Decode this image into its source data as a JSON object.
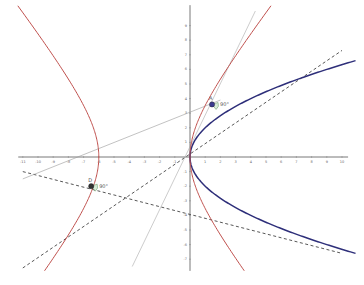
{
  "chart_data": {
    "type": "line",
    "title": "",
    "xlabel": "",
    "ylabel": "",
    "xlim": [
      -11.3,
      10.4
    ],
    "ylim": [
      -7.8,
      10.4
    ],
    "grid": false,
    "x_ticks": [
      -11,
      -10,
      -9,
      -8,
      -7,
      -6,
      -5,
      -4,
      -3,
      -2,
      -1,
      1,
      2,
      3,
      4,
      5,
      6,
      7,
      8,
      9,
      10
    ],
    "y_ticks": [
      -7,
      -6,
      -5,
      -4,
      -3,
      -2,
      -1,
      1,
      2,
      3,
      4,
      5,
      6,
      7,
      8,
      9
    ],
    "curves": [
      {
        "name": "parabola",
        "equation": "y^2 = 4x",
        "color": "#2e2f7a",
        "style": "solid"
      },
      {
        "name": "hyperbola",
        "equation": "(x+3)^2/9 - y^2/16 = 1",
        "color": "#c0504d",
        "style": "solid"
      }
    ],
    "lines": [
      {
        "name": "tangent-line-dashed-upper",
        "through": [
          [
            -11,
            -7.6
          ],
          [
            10,
            7.3
          ]
        ],
        "color": "#444444",
        "style": "dashed"
      },
      {
        "name": "tangent-line-dashed-lower",
        "through": [
          [
            -11,
            -1.0
          ],
          [
            10,
            -6.6
          ]
        ],
        "color": "#444444",
        "style": "dashed"
      },
      {
        "name": "line-gray-shallow",
        "through": [
          [
            -11,
            -1.5
          ],
          [
            2.0,
            3.9
          ]
        ],
        "color": "#999999",
        "style": "solid"
      },
      {
        "name": "line-gray-steep",
        "through": [
          [
            -3.8,
            -7.5
          ],
          [
            4.3,
            10.0
          ]
        ],
        "color": "#aaaaaa",
        "style": "solid"
      }
    ],
    "points": [
      {
        "label": "A",
        "x": 1.45,
        "y": 3.6,
        "color": "#3b3b8f"
      },
      {
        "label": "D",
        "x": -6.5,
        "y": -2.0,
        "color": "#333333"
      }
    ],
    "annotations": [
      {
        "text": "90°",
        "at": "A"
      },
      {
        "text": "90°",
        "at": "D"
      }
    ]
  }
}
